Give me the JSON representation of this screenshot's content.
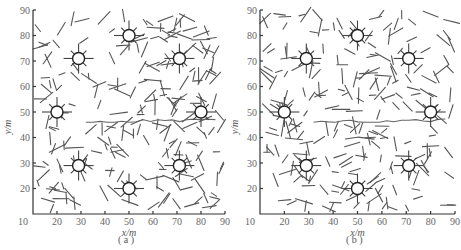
{
  "figure": {
    "panels": [
      {
        "label": "( a )",
        "x_label": "x/m",
        "y_label": "y/m"
      },
      {
        "label": "( b )",
        "x_label": "x/m",
        "y_label": "y/m"
      }
    ],
    "x_ticks": [
      "10",
      "20",
      "30",
      "40",
      "50",
      "60",
      "70",
      "80",
      "90"
    ],
    "y_ticks": [
      "10",
      "20",
      "30",
      "40",
      "50",
      "60",
      "70",
      "80",
      "90"
    ]
  },
  "chart_data": [
    {
      "type": "scatter",
      "title": "(a)",
      "xlabel": "x/m",
      "ylabel": "y/m",
      "xlim": [
        10,
        90
      ],
      "ylim": [
        10,
        90
      ],
      "grid": false,
      "nodes": [
        {
          "x": 50,
          "y": 80
        },
        {
          "x": 29,
          "y": 71
        },
        {
          "x": 71,
          "y": 71
        },
        {
          "x": 20,
          "y": 50
        },
        {
          "x": 80,
          "y": 50
        },
        {
          "x": 29,
          "y": 29
        },
        {
          "x": 71,
          "y": 29
        },
        {
          "x": 50,
          "y": 20
        }
      ],
      "path_y_approx": 50,
      "description": "Field of randomly oriented short line segments with 8 circular nodes with radiating spokes; a horizontal trajectory near y≈50"
    },
    {
      "type": "scatter",
      "title": "(b)",
      "xlabel": "x/m",
      "ylabel": "y/m",
      "xlim": [
        10,
        90
      ],
      "ylim": [
        10,
        90
      ],
      "grid": false,
      "nodes": [
        {
          "x": 50,
          "y": 80
        },
        {
          "x": 29,
          "y": 71
        },
        {
          "x": 71,
          "y": 71
        },
        {
          "x": 20,
          "y": 50
        },
        {
          "x": 80,
          "y": 50
        },
        {
          "x": 29,
          "y": 29
        },
        {
          "x": 71,
          "y": 29
        },
        {
          "x": 50,
          "y": 20
        }
      ],
      "path_y_approx": 50,
      "description": "Same node layout with a different random segment field; horizontal trajectory near y≈50"
    }
  ]
}
